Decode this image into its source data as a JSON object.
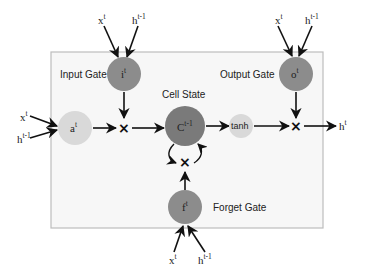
{
  "diagram": {
    "colors": {
      "background": "#ffffff",
      "box_fill": "#f7f7f7",
      "box_border": "#bdbdbd",
      "gate_dark": "#8c8c8c",
      "cell_dark": "#7a7a7a",
      "node_light": "#d9d9d9",
      "arrow": "#111111"
    },
    "labels": {
      "input_gate": "Input Gate",
      "output_gate": "Output Gate",
      "cell_state": "Cell State",
      "forget_gate": "Forget Gate"
    },
    "nodes": {
      "input_gate": {
        "base": "i",
        "sup": "t"
      },
      "output_gate": {
        "base": "o",
        "sup": "t"
      },
      "forget_gate": {
        "base": "f",
        "sup": "t"
      },
      "candidate": {
        "base": "a",
        "sup": "t"
      },
      "cell": {
        "base": "C",
        "sup": "t-1"
      },
      "tanh": {
        "text": "tanh"
      },
      "multiply": "×"
    },
    "inputs": {
      "x": {
        "base": "x",
        "sup": "t"
      },
      "h_prev": {
        "base": "h",
        "sup": "t-1"
      }
    },
    "output": {
      "base": "h",
      "sup": "t"
    }
  }
}
